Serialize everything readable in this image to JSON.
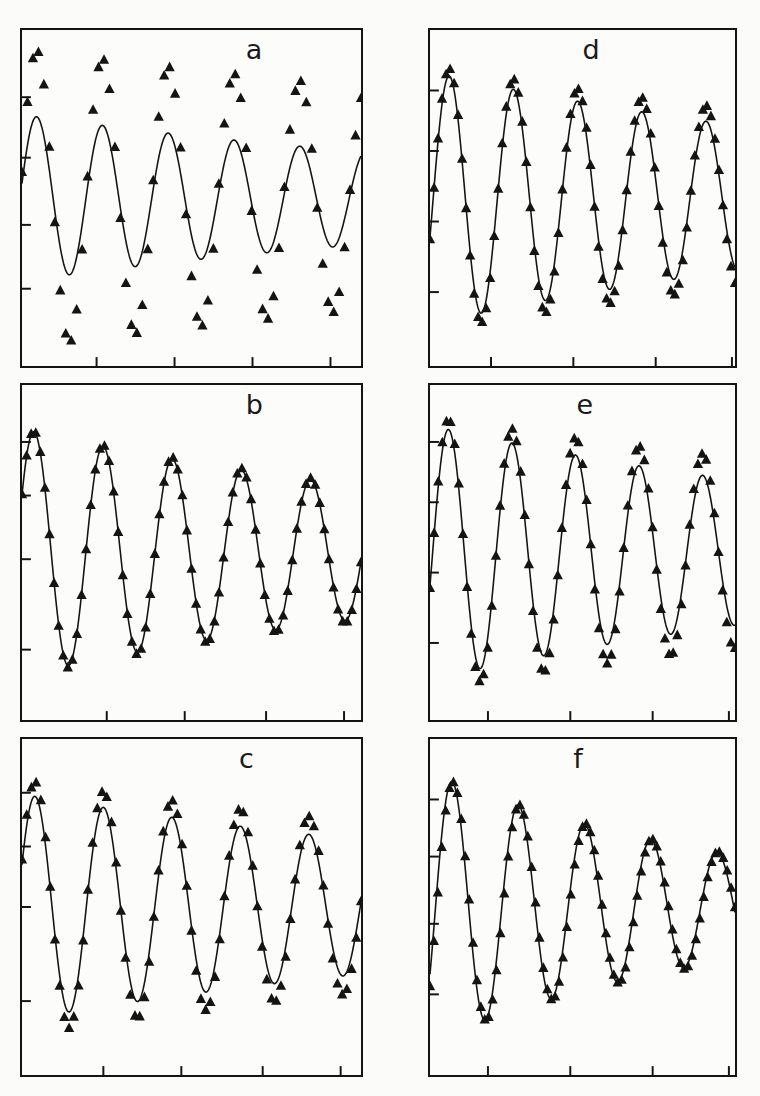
{
  "figure": {
    "kind": "multi-panel-scientific-figure",
    "layout": {
      "rows": 3,
      "cols": 2,
      "panel_count": 6
    },
    "background_color": "#fbfbfa",
    "ink_color": "#141414",
    "panel_face_color": "#fcfcfb"
  },
  "panels": [
    {
      "id": "a",
      "label": "a",
      "label_x_pct": 66,
      "rect": {
        "x": 20,
        "y": 28,
        "w": 343,
        "h": 340
      },
      "axes": {
        "left_ticks_pct": [
          20,
          38,
          58,
          77
        ],
        "bottom_ticks_pct": [
          22,
          45,
          68,
          91
        ],
        "grid": false,
        "xlabel": "",
        "ylabel": "",
        "tick_labels": []
      }
    },
    {
      "id": "b",
      "label": "b",
      "label_x_pct": 66,
      "rect": {
        "x": 20,
        "y": 383,
        "w": 343,
        "h": 339
      },
      "axes": {
        "left_ticks_pct": [
          17,
          33,
          52,
          79
        ],
        "bottom_ticks_pct": [
          25,
          48,
          72,
          95
        ],
        "grid": false,
        "xlabel": "",
        "ylabel": "",
        "tick_labels": []
      }
    },
    {
      "id": "c",
      "label": "c",
      "label_x_pct": 64,
      "rect": {
        "x": 20,
        "y": 737,
        "w": 343,
        "h": 340
      },
      "axes": {
        "left_ticks_pct": [
          16,
          32,
          50,
          78
        ],
        "bottom_ticks_pct": [
          24,
          47,
          71,
          94
        ],
        "grid": false,
        "xlabel": "",
        "ylabel": "",
        "tick_labels": []
      }
    },
    {
      "id": "d",
      "label": "d",
      "label_x_pct": 50,
      "rect": {
        "x": 428,
        "y": 28,
        "w": 309,
        "h": 340
      },
      "axes": {
        "left_ticks_pct": [
          18,
          36,
          57,
          78
        ],
        "bottom_ticks_pct": [
          20,
          47,
          74,
          99
        ],
        "grid": false,
        "xlabel": "",
        "ylabel": "",
        "tick_labels": []
      }
    },
    {
      "id": "e",
      "label": "e",
      "label_x_pct": 48,
      "rect": {
        "x": 428,
        "y": 383,
        "w": 309,
        "h": 339
      },
      "axes": {
        "left_ticks_pct": [
          17,
          35,
          56,
          77
        ],
        "bottom_ticks_pct": [
          19,
          46,
          73,
          98
        ],
        "grid": false,
        "xlabel": "",
        "ylabel": "",
        "tick_labels": []
      }
    },
    {
      "id": "f",
      "label": "f",
      "label_x_pct": 47,
      "rect": {
        "x": 428,
        "y": 737,
        "w": 309,
        "h": 340
      },
      "axes": {
        "left_ticks_pct": [
          18,
          35,
          55,
          76
        ],
        "bottom_ticks_pct": [
          19,
          46,
          73,
          98
        ],
        "grid": false,
        "xlabel": "",
        "ylabel": "",
        "tick_labels": []
      }
    }
  ],
  "chart_data": {
    "type": "line",
    "title": "",
    "xlabel": "",
    "ylabel": "",
    "series_legend": [
      {
        "name": "measured data",
        "marker": "filled-triangle-up",
        "color": "#111111"
      },
      {
        "name": "fitted model curve",
        "marker": "solid-line",
        "color": "#1a1a1a"
      }
    ],
    "x": {
      "min": 0,
      "max": 1,
      "n_samples": 70,
      "unit": "normalized time",
      "tick_labels": []
    },
    "y": {
      "min": -1.25,
      "max": 1.25,
      "unit": "normalized signal",
      "tick_labels": []
    },
    "panels": [
      {
        "id": "a",
        "label": "a",
        "cycles": 5.15,
        "fit": {
          "name": "fitted model curve",
          "amplitude": 0.62,
          "decay": 0.58,
          "frequency_cycles": 5.15,
          "phase_deg": 80,
          "offset": 0.0
        },
        "data": {
          "name": "measured data",
          "amplitude": 1.12,
          "decay": 0.3,
          "frequency_cycles": 5.15,
          "phase_deg": 80,
          "offset": 0.0,
          "n_points": 62,
          "clipped": true
        },
        "agreement": "poor"
      },
      {
        "id": "b",
        "label": "b",
        "cycles": 4.9,
        "fit": {
          "name": "fitted model curve",
          "amplitude": 0.92,
          "decay": 0.62,
          "frequency_cycles": 4.9,
          "phase_deg": 62,
          "offset": 0.0
        },
        "data": {
          "name": "measured data",
          "amplitude": 0.93,
          "decay": 0.6,
          "frequency_cycles": 4.9,
          "phase_deg": 62,
          "offset": 0.0,
          "n_points": 74,
          "clipped": false
        },
        "agreement": "excellent"
      },
      {
        "id": "c",
        "label": "c",
        "cycles": 4.95,
        "fit": {
          "name": "fitted model curve",
          "amplitude": 0.84,
          "decay": 0.52,
          "frequency_cycles": 4.95,
          "phase_deg": 68,
          "offset": 0.0
        },
        "data": {
          "name": "measured data",
          "amplitude": 0.95,
          "decay": 0.4,
          "frequency_cycles": 4.95,
          "phase_deg": 68,
          "offset": 0.0,
          "n_points": 72,
          "clipped": false
        },
        "agreement": "moderate"
      },
      {
        "id": "d",
        "label": "d",
        "cycles": 4.75,
        "fit": {
          "name": "fitted model curve",
          "amplitude": 0.94,
          "decay": 0.55,
          "frequency_cycles": 4.75,
          "phase_deg": 108,
          "offset": 0.0
        },
        "data": {
          "name": "measured data",
          "amplitude": 0.99,
          "decay": 0.4,
          "frequency_cycles": 4.75,
          "phase_deg": 108,
          "offset": 0.0,
          "n_points": 76,
          "clipped": false
        },
        "agreement": "good"
      },
      {
        "id": "e",
        "label": "e",
        "cycles": 4.8,
        "fit": {
          "name": "fitted model curve",
          "amplitude": 0.95,
          "decay": 0.56,
          "frequency_cycles": 4.8,
          "phase_deg": 105,
          "offset": 0.0
        },
        "data": {
          "name": "measured data",
          "amplitude": 1.02,
          "decay": 0.36,
          "frequency_cycles": 4.8,
          "phase_deg": 105,
          "offset": 0.0,
          "n_points": 74,
          "clipped": false
        },
        "agreement": "good-then-diverging"
      },
      {
        "id": "f",
        "label": "f",
        "cycles": 4.6,
        "fit": {
          "name": "fitted model curve",
          "amplitude": 1.0,
          "decay": 0.95,
          "frequency_cycles": 4.6,
          "phase_deg": 120,
          "offset": 0.0
        },
        "data": {
          "name": "measured data",
          "amplitude": 1.0,
          "decay": 0.93,
          "frequency_cycles": 4.6,
          "phase_deg": 126,
          "offset": 0.0,
          "n_points": 78,
          "clipped": false
        },
        "agreement": "excellent"
      }
    ]
  }
}
